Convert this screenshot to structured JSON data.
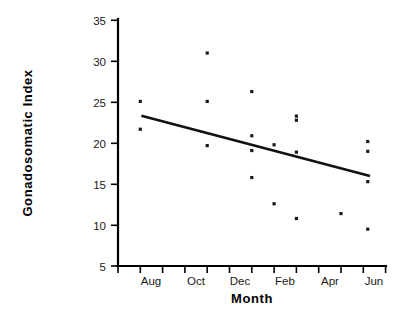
{
  "chart_data": {
    "type": "scatter",
    "title": "",
    "xlabel": "Month",
    "ylabel": "Gonadosomatic Index",
    "xlim": [
      0,
      12
    ],
    "ylim": [
      5,
      35
    ],
    "grid": false,
    "legend": null,
    "y_ticks": [
      5,
      10,
      15,
      20,
      25,
      30,
      35
    ],
    "y_tick_labels": [
      "5",
      "10",
      "15",
      "20",
      "25",
      "30",
      "35"
    ],
    "x_tick_labels": [
      "Aug",
      "Oct",
      "Dec",
      "Feb",
      "Apr",
      "Jun"
    ],
    "x_tick_count": 12,
    "series": [
      {
        "name": "Gonadosomatic index observations",
        "points": [
          {
            "month": "Aug",
            "x": 1.0,
            "y": 25.1
          },
          {
            "month": "Aug",
            "x": 1.0,
            "y": 21.7
          },
          {
            "month": "Nov",
            "x": 4.0,
            "y": 31.0
          },
          {
            "month": "Nov",
            "x": 4.0,
            "y": 25.1
          },
          {
            "month": "Nov",
            "x": 4.0,
            "y": 19.7
          },
          {
            "month": "Jan",
            "x": 6.0,
            "y": 26.3
          },
          {
            "month": "Jan",
            "x": 6.0,
            "y": 20.9
          },
          {
            "month": "Jan",
            "x": 6.0,
            "y": 19.1
          },
          {
            "month": "Jan",
            "x": 6.0,
            "y": 15.8
          },
          {
            "month": "Feb",
            "x": 7.0,
            "y": 19.8
          },
          {
            "month": "Feb",
            "x": 7.0,
            "y": 12.6
          },
          {
            "month": "Mar",
            "x": 8.0,
            "y": 23.3
          },
          {
            "month": "Mar",
            "x": 8.0,
            "y": 22.8
          },
          {
            "month": "Mar",
            "x": 8.0,
            "y": 18.9
          },
          {
            "month": "Mar",
            "x": 8.0,
            "y": 10.8
          },
          {
            "month": "May",
            "x": 10.0,
            "y": 11.4
          },
          {
            "month": "Jun",
            "x": 11.2,
            "y": 20.2
          },
          {
            "month": "Jun",
            "x": 11.2,
            "y": 19.0
          },
          {
            "month": "Jun",
            "x": 11.2,
            "y": 15.3
          },
          {
            "month": "Jun",
            "x": 11.2,
            "y": 9.5
          }
        ]
      }
    ],
    "trend_line": {
      "name": "linear regression fit",
      "x_start": 1.05,
      "y_start": 23.35,
      "x_end": 11.3,
      "y_end": 16.0
    }
  }
}
